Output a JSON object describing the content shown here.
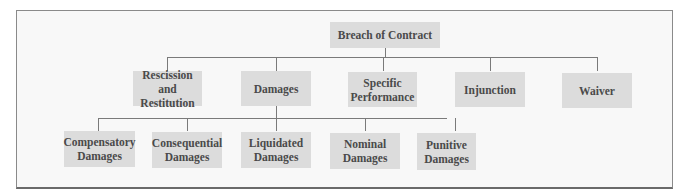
{
  "diagram": {
    "type": "tree",
    "root": {
      "label": "Breach of Contract"
    },
    "level1": [
      {
        "label": "Rescission and Restitution"
      },
      {
        "label": "Damages"
      },
      {
        "label": "Specific Performance"
      },
      {
        "label": "Injunction"
      },
      {
        "label": "Waiver"
      }
    ],
    "level2_parent": "Damages",
    "level2": [
      {
        "label": "Compensatory Damages"
      },
      {
        "label": "Consequential Damages"
      },
      {
        "label": "Liquidated Damages"
      },
      {
        "label": "Nominal Damages"
      },
      {
        "label": "Punitive Damages"
      }
    ]
  },
  "colors": {
    "node_fill": "#dcdcdc",
    "node_text": "#4a4a4a",
    "connector": "#7a7a7a",
    "frame_border": "#8a8a8a"
  }
}
